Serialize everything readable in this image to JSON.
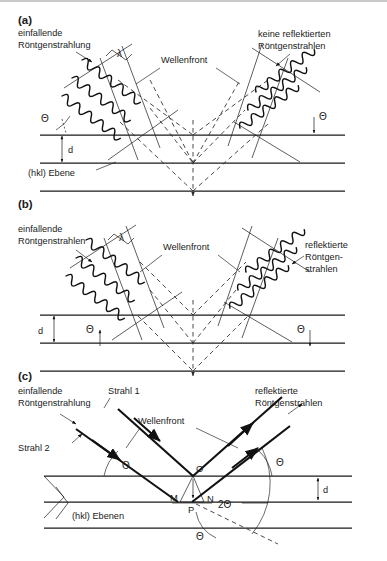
{
  "figure": {
    "type": "scientific-diagram",
    "language": "de",
    "background_color": "#ffffff",
    "line_color": "#1a1a1a"
  },
  "panels": [
    {
      "id": "a",
      "label": "(a)",
      "description": "Nicht-konstruktive Interferenz: keine reflektierten Röntgenstrahlen",
      "labels": {
        "incoming": "einfallende\nRöntgenstrahlung",
        "incoming_line1": "einfallende",
        "incoming_line2": "Röntgenstrahlung",
        "outgoing_line1": "keine reflektierten",
        "outgoing_line2": "Röntgenstrahlen",
        "wavefront": "Wellenfront",
        "spacing": "d",
        "planes": "(hkl) Ebene",
        "angle_left": "Θ",
        "angle_right": "Θ",
        "wavelength": "λ"
      }
    },
    {
      "id": "b",
      "label": "(b)",
      "description": "Konstruktive Interferenz: reflektierte Röntgenstrahlen",
      "labels": {
        "incoming_line1": "einfallende",
        "incoming_line2": "Röntgenstrahlen",
        "outgoing_line1": "reflektierte",
        "outgoing_line2": "Röntgen-",
        "outgoing_line3": "strahlen",
        "wavefront": "Wellenfront",
        "spacing": "d",
        "angle_left": "Θ",
        "angle_right": "Θ",
        "wavelength": "λ"
      }
    },
    {
      "id": "c",
      "label": "(c)",
      "description": "Geometrische Herleitung der Bragg-Gleichung",
      "labels": {
        "incoming_line1": "einfallende",
        "incoming_line2": "Röntgenstrahlung",
        "outgoing_line1": "reflektierte",
        "outgoing_line2": "Röntgenstrahlen",
        "ray1": "Strahl 1",
        "ray2": "Strahl 2",
        "wavefront": "Wellenfront",
        "spacing": "d",
        "planes": "(hkl) Ebenen",
        "angle_left": "Θ",
        "angle_right": "Θ",
        "angle_bottom": "Θ",
        "angle_double": "2Θ",
        "point_o": "O",
        "point_m": "M",
        "point_n": "N",
        "point_p": "P"
      }
    }
  ]
}
